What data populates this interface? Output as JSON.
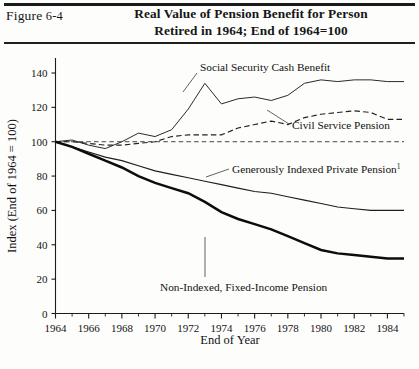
{
  "figure": {
    "label_prefix": "Figure",
    "label_number": "6-4",
    "title_line1": "Real Value of Pension Benefit for Person",
    "title_line2": "Retired in 1964; End of 1964=100"
  },
  "chart_data": {
    "type": "line",
    "title": "Real Value of Pension Benefit for Person Retired in 1964; End of 1964=100",
    "xlabel": "End of Year",
    "ylabel": "Index (End of 1964 = 100)",
    "xlim": [
      1964,
      1985
    ],
    "ylim": [
      0,
      140
    ],
    "ytick_values": [
      0,
      20,
      40,
      60,
      80,
      100,
      120,
      140
    ],
    "ytick_labels": [
      "0",
      "20",
      "40",
      "60",
      "80",
      "100",
      "120",
      "140"
    ],
    "xtick_major_values": [
      1964,
      1966,
      1968,
      1970,
      1972,
      1974,
      1976,
      1978,
      1980,
      1982,
      1984
    ],
    "xtick_major_labels": [
      "1964",
      "1966",
      "1968",
      "1970",
      "1972",
      "1974",
      "1976",
      "1978",
      "1980",
      "1982",
      "1984"
    ],
    "xtick_minor_values": [
      1965,
      1967,
      1969,
      1971,
      1973,
      1975,
      1977,
      1979,
      1981,
      1983,
      1985
    ],
    "grid": false,
    "legend_position": "inline-annotations",
    "x": [
      1964,
      1965,
      1966,
      1967,
      1968,
      1969,
      1970,
      1971,
      1972,
      1973,
      1974,
      1975,
      1976,
      1977,
      1978,
      1979,
      1980,
      1981,
      1982,
      1983,
      1984,
      1985
    ],
    "series": [
      {
        "name": "Social Security Cash Benefit",
        "style": "solid-thin",
        "values": [
          100,
          101,
          98,
          96,
          100,
          105,
          103,
          107,
          119,
          134,
          122,
          125,
          126,
          124,
          127,
          134,
          136,
          135,
          136,
          136,
          135,
          135
        ]
      },
      {
        "name": "Civil Service Pension",
        "style": "dashed",
        "values": [
          100,
          100,
          99,
          98,
          98,
          99,
          100,
          103,
          104,
          104,
          104,
          108,
          110,
          112,
          110,
          114,
          116,
          117,
          118,
          117,
          113,
          113
        ]
      },
      {
        "name": "Generously Indexed Private Pension",
        "style": "solid-thin",
        "footnote_marker": "1",
        "values": [
          100,
          97,
          94,
          91,
          89,
          86,
          83,
          81,
          79,
          77,
          75,
          73,
          71,
          70,
          68,
          66,
          64,
          62,
          61,
          60,
          60,
          60
        ]
      },
      {
        "name": "Non-Indexed, Fixed-Income Pension",
        "style": "solid-thick",
        "values": [
          100,
          97,
          93,
          89,
          85,
          80,
          76,
          73,
          70,
          65,
          59,
          55,
          52,
          49,
          45,
          41,
          37,
          35,
          34,
          33,
          32,
          32
        ]
      },
      {
        "name": "Reference line (index = 100)",
        "style": "dashed-reference",
        "values": [
          100,
          100,
          100,
          100,
          100,
          100,
          100,
          100,
          100,
          100,
          100,
          100,
          100,
          100,
          100,
          100,
          100,
          100,
          100,
          100,
          100,
          100
        ]
      }
    ],
    "annotations": [
      {
        "text": "Social Security Cash Benefit",
        "series": "Social Security Cash Benefit"
      },
      {
        "text": "Civil Service Pension",
        "series": "Civil Service Pension"
      },
      {
        "text": "Generously Indexed Private Pension",
        "series": "Generously Indexed Private Pension",
        "footnote_marker": "1"
      },
      {
        "text": "Non-Indexed, Fixed-Income Pension",
        "series": "Non-Indexed, Fixed-Income Pension"
      }
    ]
  }
}
